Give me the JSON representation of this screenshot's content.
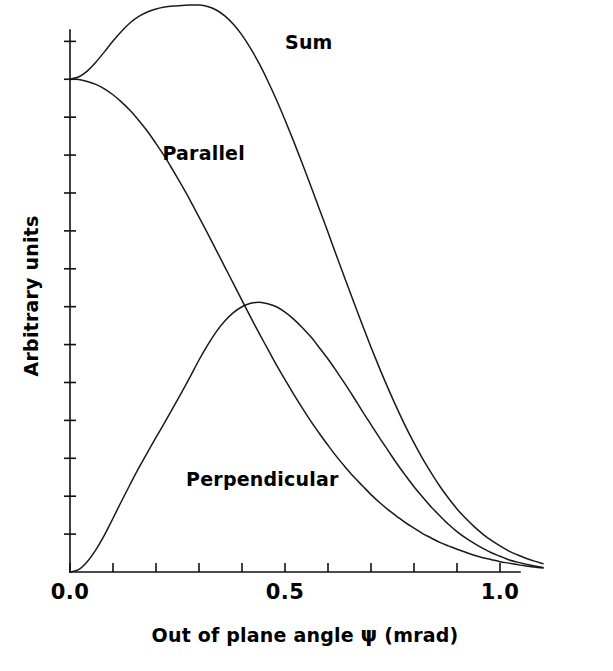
{
  "figure": {
    "background_color": "#ffffff",
    "ink_color": "#000000"
  },
  "chart_data": {
    "type": "line",
    "title": "",
    "subtitle": "",
    "xlabel_parts": {
      "prefix": "Out of plane angle ",
      "symbol": "ψ",
      "suffix": " (mrad)"
    },
    "xlabel": "Out of plane angle ψ (mrad)",
    "ylabel": "Arbitrary units",
    "xlim": [
      0.0,
      1.12
    ],
    "ylim": [
      0.0,
      1.3
    ],
    "grid": false,
    "legend_position": "inline-annotations",
    "x_tick_labels": [
      "0.0",
      "0.5",
      "1.0"
    ],
    "x_tick_label_values": [
      0.0,
      0.5,
      1.0
    ],
    "x_minor_tick_values": [
      0.0,
      0.1,
      0.2,
      0.3,
      0.4,
      0.5,
      0.6,
      0.7,
      0.8,
      0.9,
      1.0
    ],
    "y_tick_labels": [],
    "y_tick_count": 14,
    "annotations": [
      {
        "text": "Sum",
        "x": 0.5,
        "y": 1.06
      },
      {
        "text": "Parallel",
        "x": 0.215,
        "y": 0.835
      },
      {
        "text": "Perpendicular",
        "x": 0.27,
        "y": 0.175
      }
    ],
    "x": [
      0.0,
      0.02,
      0.04,
      0.06,
      0.08,
      0.1,
      0.12,
      0.14,
      0.16,
      0.18,
      0.2,
      0.22,
      0.24,
      0.26,
      0.28,
      0.3,
      0.32,
      0.34,
      0.36,
      0.38,
      0.4,
      0.42,
      0.44,
      0.46,
      0.48,
      0.5,
      0.52,
      0.54,
      0.56,
      0.58,
      0.6,
      0.62,
      0.64,
      0.66,
      0.68,
      0.7,
      0.72,
      0.74,
      0.76,
      0.78,
      0.8,
      0.82,
      0.84,
      0.86,
      0.88,
      0.9,
      0.92,
      0.94,
      0.96,
      0.98,
      1.0,
      1.02,
      1.04,
      1.06,
      1.08,
      1.1
    ],
    "series": [
      {
        "name": "Sum",
        "values": [
          1.0,
          1.004,
          1.016,
          1.034,
          1.055,
          1.077,
          1.097,
          1.114,
          1.127,
          1.136,
          1.142,
          1.146,
          1.148,
          1.149,
          1.15,
          1.15,
          1.147,
          1.14,
          1.128,
          1.111,
          1.089,
          1.062,
          1.031,
          0.996,
          0.958,
          0.917,
          0.874,
          0.829,
          0.783,
          0.736,
          0.689,
          0.641,
          0.594,
          0.547,
          0.501,
          0.456,
          0.413,
          0.372,
          0.333,
          0.296,
          0.262,
          0.23,
          0.201,
          0.174,
          0.15,
          0.128,
          0.109,
          0.092,
          0.077,
          0.064,
          0.053,
          0.043,
          0.035,
          0.028,
          0.022,
          0.017
        ]
      },
      {
        "name": "Parallel",
        "values": [
          1.0,
          0.999,
          0.995,
          0.989,
          0.98,
          0.968,
          0.953,
          0.936,
          0.916,
          0.894,
          0.869,
          0.843,
          0.814,
          0.784,
          0.753,
          0.72,
          0.687,
          0.653,
          0.619,
          0.585,
          0.551,
          0.517,
          0.484,
          0.452,
          0.42,
          0.39,
          0.361,
          0.333,
          0.306,
          0.281,
          0.257,
          0.234,
          0.213,
          0.193,
          0.175,
          0.157,
          0.141,
          0.126,
          0.113,
          0.1,
          0.089,
          0.078,
          0.069,
          0.06,
          0.053,
          0.046,
          0.04,
          0.034,
          0.029,
          0.025,
          0.021,
          0.018,
          0.015,
          0.012,
          0.01,
          0.008
        ]
      },
      {
        "name": "Perpendicular",
        "values": [
          0.0,
          0.005,
          0.021,
          0.045,
          0.075,
          0.109,
          0.144,
          0.178,
          0.211,
          0.242,
          0.273,
          0.303,
          0.334,
          0.365,
          0.397,
          0.43,
          0.46,
          0.487,
          0.509,
          0.526,
          0.538,
          0.545,
          0.547,
          0.544,
          0.538,
          0.527,
          0.513,
          0.496,
          0.477,
          0.455,
          0.432,
          0.407,
          0.381,
          0.354,
          0.326,
          0.299,
          0.272,
          0.246,
          0.22,
          0.196,
          0.173,
          0.152,
          0.132,
          0.114,
          0.097,
          0.082,
          0.069,
          0.058,
          0.048,
          0.039,
          0.032,
          0.025,
          0.02,
          0.016,
          0.012,
          0.009
        ]
      }
    ]
  }
}
